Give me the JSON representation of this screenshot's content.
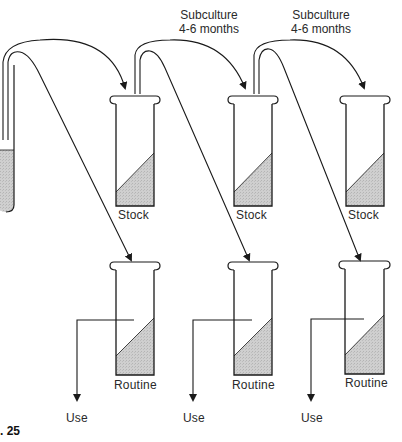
{
  "figure": {
    "number_label": ". 25",
    "subculture_labels": [
      {
        "line1": "Subculture",
        "line2": "4-6 months"
      },
      {
        "line1": "Subculture",
        "line2": "4-6 months"
      }
    ],
    "stock_tubes": [
      {
        "label": "Stock"
      },
      {
        "label": "Stock"
      },
      {
        "label": "Stock"
      }
    ],
    "routine_tubes": [
      {
        "label": "Routine",
        "output": "Use"
      },
      {
        "label": "Routine",
        "output": "Use"
      },
      {
        "label": "Routine",
        "output": "Use"
      }
    ],
    "colors": {
      "line": "#1a1a1a",
      "fill": "#c9c9c9",
      "background": "#ffffff"
    }
  }
}
